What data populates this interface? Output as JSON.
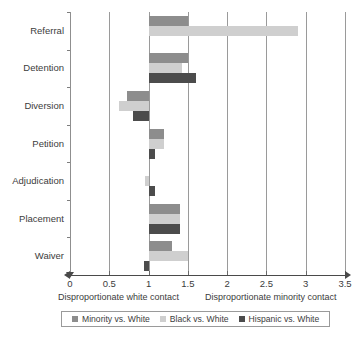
{
  "chart_data": {
    "type": "bar",
    "orientation": "horizontal",
    "title": "",
    "subtitle": "",
    "xlabel": "",
    "ylabel": "",
    "xlim": [
      0,
      3.5
    ],
    "grid": true,
    "legend_position": "bottom",
    "reference_line": 1,
    "categories": [
      "Referral",
      "Detention",
      "Diversion",
      "Petition",
      "Adjudication",
      "Placement",
      "Waiver"
    ],
    "xticks": [
      "0",
      "0.5",
      "1",
      "1.5",
      "2",
      "2.5",
      "3",
      "3.5"
    ],
    "xtick_values": [
      0,
      0.5,
      1,
      1.5,
      2,
      2.5,
      3,
      3.5
    ],
    "series": [
      {
        "name": "Minority vs. White",
        "color": "#8d8d8d",
        "values": [
          1.5,
          1.5,
          0.73,
          1.2,
          1.0,
          1.4,
          1.3
        ]
      },
      {
        "name": "Black vs. White",
        "color": "#cfcfcf",
        "values": [
          2.9,
          1.43,
          0.62,
          1.2,
          0.95,
          1.4,
          1.5
        ]
      },
      {
        "name": "Hispanic vs. White",
        "color": "#4c4c4c",
        "values": [
          1.0,
          1.6,
          0.8,
          1.08,
          1.08,
          1.4,
          0.94
        ]
      }
    ],
    "annotations": {
      "left_caption": "Disproportionate white contact",
      "right_caption": "Disproportionate minority contact"
    }
  },
  "legend": {
    "items": [
      {
        "label": "Minority vs. White",
        "color": "#8d8d8d"
      },
      {
        "label": "Black vs. White",
        "color": "#cfcfcf"
      },
      {
        "label": "Hispanic vs. White",
        "color": "#4c4c4c"
      }
    ]
  }
}
